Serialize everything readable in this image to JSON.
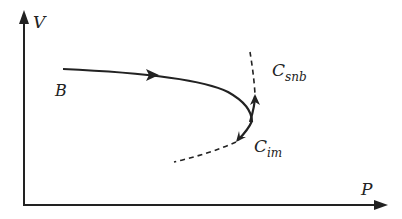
{
  "diagram": {
    "axes": {
      "y_label": "V",
      "x_label": "P"
    },
    "labels": {
      "start_point": "B",
      "c_snb_main": "C",
      "c_snb_sub": "snb",
      "c_im_main": "C",
      "c_im_sub": "im"
    },
    "colors": {
      "stroke": "#222222",
      "background": "#ffffff"
    }
  }
}
